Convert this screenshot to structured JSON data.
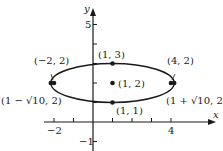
{
  "figure": {
    "axes": {
      "x_label": "x",
      "y_label": "y",
      "x_ticks": [
        {
          "value": -2,
          "label": "−2"
        },
        {
          "value": -1,
          "label": ""
        },
        {
          "value": 1,
          "label": ""
        },
        {
          "value": 2,
          "label": ""
        },
        {
          "value": 3,
          "label": ""
        },
        {
          "value": 4,
          "label": "4"
        }
      ],
      "y_ticks": [
        {
          "value": -1,
          "label": "−1"
        },
        {
          "value": 1,
          "label": ""
        },
        {
          "value": 2,
          "label": ""
        },
        {
          "value": 3,
          "label": ""
        },
        {
          "value": 4,
          "label": ""
        },
        {
          "value": 5,
          "label": "5"
        }
      ]
    },
    "ellipse": {
      "center": [
        1,
        2
      ],
      "a": 3.1623,
      "b": 1,
      "equation": "(x-1)^2/10 + (y-2)^2/1 = 1"
    },
    "points": [
      {
        "id": "center",
        "label": "(1, 2)",
        "x": 1,
        "y": 2
      },
      {
        "id": "top-vertex",
        "label": "(1, 3)",
        "x": 1,
        "y": 3
      },
      {
        "id": "bottom-vertex",
        "label": "(1, 1)",
        "x": 1,
        "y": 1
      },
      {
        "id": "left-focus",
        "label": "(−2, 2)",
        "x": -2,
        "y": 2
      },
      {
        "id": "right-focus",
        "label": "(4, 2)",
        "x": 4,
        "y": 2
      },
      {
        "id": "left-vertex",
        "label": "(1 − √10, 2)",
        "x": -2.1623,
        "y": 2
      },
      {
        "id": "right-vertex",
        "label": "(1 + √10, 2)",
        "x": 4.1623,
        "y": 2
      }
    ],
    "colors": {
      "ink": "#1a1a1a",
      "background": "#ffffff"
    }
  }
}
